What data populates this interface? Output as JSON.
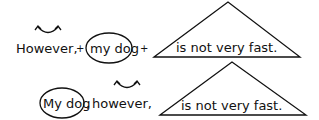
{
  "diagram": {
    "row1": {
      "word_however": "However,",
      "plus1": "+",
      "subject": "my dog",
      "plus2": "+",
      "predicate": "is not very fast."
    },
    "row2": {
      "subject": "My dog",
      "comma": ",",
      "word_however": "however,",
      "predicate": "is not very fast."
    },
    "colors": {
      "ink": "#111111",
      "background": "#ffffff"
    }
  }
}
